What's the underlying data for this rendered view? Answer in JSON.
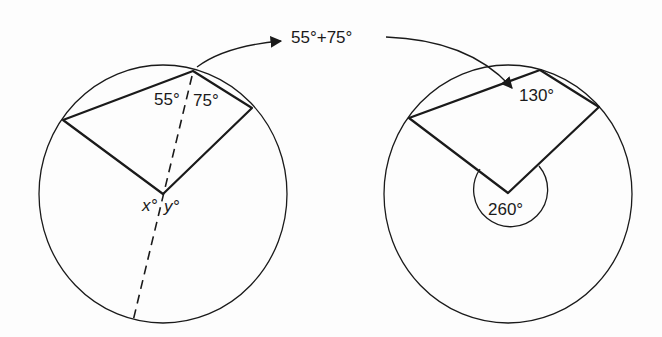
{
  "figure": {
    "left_diagram": {
      "angle_labels": {
        "top_left": "55°",
        "top_right": "75°",
        "center_left": "x°",
        "center_right": "y°"
      }
    },
    "transfer_annotation": {
      "expression": "55°+75°"
    },
    "right_diagram": {
      "angle_labels": {
        "top": "130°",
        "center_reflex": "260°"
      }
    },
    "colors": {
      "ink": "#1a1a1a",
      "background": "#fdfdfd"
    }
  }
}
